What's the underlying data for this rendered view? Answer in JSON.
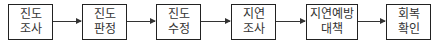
{
  "diagram": {
    "type": "flowchart",
    "direction": "left-to-right",
    "steps": [
      {
        "line1": "진도",
        "line2": "조사"
      },
      {
        "line1": "진도",
        "line2": "판정"
      },
      {
        "line1": "진도",
        "line2": "수정"
      },
      {
        "line1": "지연",
        "line2": "조사"
      },
      {
        "line1": "지연예방",
        "line2": "대책"
      },
      {
        "line1": "회복",
        "line2": "확인"
      }
    ],
    "connectors": [
      {
        "from": 0,
        "to": 1
      },
      {
        "from": 1,
        "to": 2
      },
      {
        "from": 2,
        "to": 3
      },
      {
        "from": 3,
        "to": 4
      },
      {
        "from": 4,
        "to": 5
      }
    ],
    "colors": {
      "border": "#222222",
      "text": "#333333",
      "arrow": "#333333",
      "background": "#ffffff"
    }
  }
}
